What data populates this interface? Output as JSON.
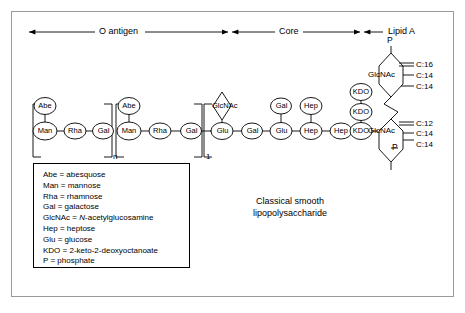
{
  "figure": {
    "caption_line1": "Classical smooth",
    "caption_line2": "lipopolysaccharide",
    "caption_full": "Classical smooth lipopolysaccharide"
  },
  "regions": [
    {
      "id": "o-antigen",
      "label": "O antigen"
    },
    {
      "id": "core",
      "label": "Core"
    },
    {
      "id": "lipid-a",
      "label": "Lipid A"
    }
  ],
  "repeat_markers": {
    "o_antigen_repeat": "n",
    "core_repeat": "1"
  },
  "chain": {
    "o_antigen_unit_1": {
      "backbone": [
        "Man",
        "Rha",
        "Gal"
      ],
      "branch": "Abe"
    },
    "o_antigen_unit_2": {
      "backbone": [
        "Man",
        "Rha",
        "Gal"
      ],
      "branch": "Abe"
    },
    "core": {
      "backbone": [
        "Glu",
        "Gal",
        "Glu",
        "Hep",
        "Hep",
        "KDO"
      ],
      "branches": {
        "glu_1": "GlcNAc",
        "glu_2": "Gal",
        "hep_1": "Hep"
      },
      "kdo_stack": [
        "KDO",
        "KDO",
        "KDO"
      ]
    },
    "lipid_a": {
      "upper_sugar": "GlcNAc",
      "lower_sugar": "GlcNAc",
      "upper_phosphate": "P",
      "lower_phosphate": "P",
      "upper_acyl_chains": [
        "C:16",
        "C:14",
        "C:14"
      ],
      "lower_acyl_chains": [
        "C:12",
        "C:14",
        "C:14"
      ]
    }
  },
  "legend": {
    "entries": [
      {
        "abbr": "Abe",
        "sep": " = ",
        "name": "abesquose",
        "italic_prefix": ""
      },
      {
        "abbr": "Man",
        "sep": " = ",
        "name": "mannose",
        "italic_prefix": ""
      },
      {
        "abbr": "Rha",
        "sep": " = ",
        "name": "rhamnose",
        "italic_prefix": ""
      },
      {
        "abbr": "Gal",
        "sep": " = ",
        "name": "galactose",
        "italic_prefix": ""
      },
      {
        "abbr": "GlcNAc",
        "sep": " = ",
        "name": "-acetylglucosamine",
        "italic_prefix": "N"
      },
      {
        "abbr": "Hep",
        "sep": " = ",
        "name": "heptose",
        "italic_prefix": ""
      },
      {
        "abbr": "Glu",
        "sep": " = ",
        "name": "glucose",
        "italic_prefix": ""
      },
      {
        "abbr": "KDO",
        "sep": " = ",
        "name": "2-keto-2-deoxyoctanoate",
        "italic_prefix": ""
      },
      {
        "abbr": "P",
        "sep": " = ",
        "name": "phosphate",
        "italic_prefix": ""
      }
    ]
  },
  "colors": {
    "stroke": "#000000",
    "frame": "#9a9a9a",
    "background": "#ffffff"
  }
}
